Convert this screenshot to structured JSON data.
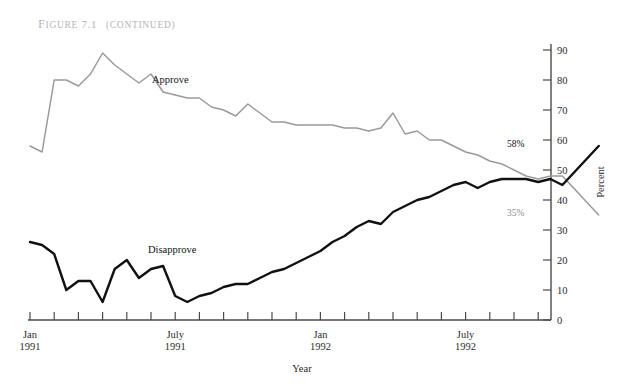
{
  "figure": {
    "caption_prefix": "Figure",
    "caption_number": "7.1",
    "caption_suffix": "(continued)",
    "caption_full": "FIGURE 7.1 (CONTINUED)"
  },
  "axes": {
    "x_title": "Year",
    "y_title": "Percent",
    "y_ticks": [
      "0",
      "10",
      "20",
      "30",
      "40",
      "50",
      "60",
      "70",
      "80",
      "90"
    ],
    "x_tick_labels": [
      {
        "line1": "Jan",
        "line2": "1991"
      },
      {
        "line1": "July",
        "line2": "1991"
      },
      {
        "line1": "Jan",
        "line2": "1992"
      },
      {
        "line1": "July",
        "line2": "1992"
      }
    ]
  },
  "annotations": {
    "approve_label": "Approve",
    "disapprove_label": "Disapprove",
    "approve_end_value": "35%",
    "disapprove_end_value": "58%"
  },
  "colors": {
    "approve_line": "#9a9a9a",
    "disapprove_line": "#111111",
    "axis": "#4a4a4a",
    "caption": "#b4b4b4",
    "background": "#ffffff"
  },
  "chart_data": {
    "type": "line",
    "xlabel": "Year",
    "ylabel": "Percent",
    "ylim": [
      0,
      90
    ],
    "grid": false,
    "legend": "inline-annotations",
    "x_axis_type": "monthly",
    "x_start": "1991-01",
    "x_end": "1992-12",
    "x_major_ticks": [
      "Jan 1991",
      "July 1991",
      "Jan 1992",
      "July 1992"
    ],
    "x": [
      "1991-01-a",
      "1991-01-b",
      "1991-02-a",
      "1991-02-b",
      "1991-03-a",
      "1991-03-b",
      "1991-04-a",
      "1991-04-b",
      "1991-05-a",
      "1991-05-b",
      "1991-06-a",
      "1991-06-b",
      "1991-07-a",
      "1991-07-b",
      "1991-08-a",
      "1991-08-b",
      "1991-09-a",
      "1991-09-b",
      "1991-10-a",
      "1991-10-b",
      "1991-11-a",
      "1991-11-b",
      "1991-12-a",
      "1991-12-b",
      "1992-01-a",
      "1992-01-b",
      "1992-02-a",
      "1992-02-b",
      "1992-03-a",
      "1992-03-b",
      "1992-04-a",
      "1992-04-b",
      "1992-05-a",
      "1992-05-b",
      "1992-06-a",
      "1992-06-b",
      "1992-07-a",
      "1992-07-b",
      "1992-08-a",
      "1992-08-b",
      "1992-09-a",
      "1992-09-b",
      "1992-10-a",
      "1992-10-b",
      "1992-11-a"
    ],
    "series": [
      {
        "name": "Approve",
        "color": "#9a9a9a",
        "end_label": "35%",
        "values": [
          58,
          56,
          80,
          80,
          78,
          82,
          89,
          85,
          82,
          79,
          82,
          76,
          75,
          74,
          74,
          71,
          70,
          68,
          72,
          69,
          66,
          66,
          65,
          65,
          65,
          65,
          64,
          64,
          63,
          64,
          69,
          62,
          63,
          60,
          60,
          58,
          56,
          55,
          53,
          52,
          50,
          48,
          47,
          48,
          48
        ]
      },
      {
        "name": "Disapprove",
        "color": "#111111",
        "end_label": "58%",
        "values": [
          26,
          25,
          22,
          10,
          13,
          13,
          6,
          17,
          20,
          14,
          17,
          18,
          8,
          6,
          8,
          9,
          11,
          12,
          12,
          14,
          16,
          17,
          19,
          21,
          23,
          26,
          28,
          31,
          33,
          32,
          36,
          38,
          40,
          41,
          43,
          45,
          46,
          44,
          46,
          47,
          47,
          47,
          46,
          47,
          45
        ]
      }
    ],
    "series_tail": {
      "note": "lines continue to end-of-series annotated values",
      "approve_final": 35,
      "disapprove_final": 58
    }
  }
}
